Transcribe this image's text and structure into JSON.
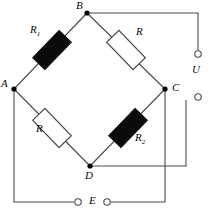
{
  "diagram": {
    "type": "wheatstone-bridge-circuit",
    "colors": {
      "wire": "#4a4a4a",
      "node": "#000000",
      "resistor_filled": "#0b0b0b",
      "resistor_outline": "#4a4a4a",
      "resistor_fill_empty": "#ffffff",
      "text": "#0a0a0a",
      "background": "#ffffff"
    },
    "nodes": [
      {
        "id": "B",
        "label": "B",
        "x": 87,
        "y": 13,
        "label_x": 76,
        "label_y": 2
      },
      {
        "id": "A",
        "label": "A",
        "x": 14,
        "y": 89,
        "label_x": 2,
        "label_y": 80
      },
      {
        "id": "C",
        "label": "C",
        "x": 165,
        "y": 89,
        "label_x": 172,
        "label_y": 82
      },
      {
        "id": "D",
        "label": "D",
        "x": 90,
        "y": 166,
        "label_x": 85,
        "label_y": 170
      }
    ],
    "resistors": [
      {
        "id": "R1",
        "label": "R",
        "sub": "1",
        "style": "filled",
        "branch": "A-B",
        "cx": 52,
        "cy": 50,
        "w": 38,
        "h": 17,
        "angle": -46,
        "label_x": 30,
        "label_y": 26
      },
      {
        "id": "R_top_right",
        "label": "R",
        "sub": "",
        "style": "empty",
        "branch": "B-C",
        "cx": 126,
        "cy": 50,
        "w": 38,
        "h": 17,
        "angle": 46,
        "label_x": 136,
        "label_y": 28
      },
      {
        "id": "R_bottom_left",
        "label": "R",
        "sub": "",
        "style": "empty",
        "branch": "A-D",
        "cx": 52,
        "cy": 128,
        "w": 38,
        "h": 17,
        "angle": 46,
        "label_x": 37,
        "label_y": 128
      },
      {
        "id": "R2",
        "label": "R",
        "sub": "2",
        "style": "filled",
        "branch": "D-C",
        "cx": 128,
        "cy": 128,
        "w": 38,
        "h": 17,
        "angle": -46,
        "label_x": 135,
        "label_y": 134
      }
    ],
    "terminals": [
      {
        "id": "U-top",
        "label": "",
        "x": 198,
        "y": 54,
        "r": 3.2,
        "connects": "B"
      },
      {
        "id": "U-bottom",
        "label": "",
        "x": 198,
        "y": 97,
        "r": 3.2,
        "connects": "D"
      },
      {
        "id": "E-left",
        "label": "",
        "x": 78,
        "y": 202,
        "r": 3.2,
        "connects": "A"
      },
      {
        "id": "E-right",
        "label": "",
        "x": 107,
        "y": 202,
        "r": 3.2,
        "connects": "C"
      }
    ],
    "terminal_labels": [
      {
        "id": "U",
        "label": "U",
        "x": 192,
        "y": 70,
        "for": "U-pair"
      },
      {
        "id": "E",
        "label": "E",
        "x": 90,
        "y": 195,
        "for": "E-pair"
      }
    ],
    "wires": [
      {
        "id": "wire-B-to-U-top",
        "path": "M 87 13 L 198 13 L 198 50"
      },
      {
        "id": "wire-D-to-U-bottom",
        "path": "M 90 166 L 186 166 L 186 100"
      },
      {
        "id": "wire-A-to-E-left",
        "path": "M 14 89 L 14 202 L 74 202"
      },
      {
        "id": "wire-E-right-to-C",
        "path": "M 111 202 L 165 202 L 165 89"
      }
    ],
    "bridge_arms": [
      {
        "id": "arm-A-B",
        "from": "A",
        "to": "B"
      },
      {
        "id": "arm-B-C",
        "from": "B",
        "to": "C"
      },
      {
        "id": "arm-A-D",
        "from": "A",
        "to": "D"
      },
      {
        "id": "arm-D-C",
        "from": "D",
        "to": "C"
      }
    ]
  }
}
